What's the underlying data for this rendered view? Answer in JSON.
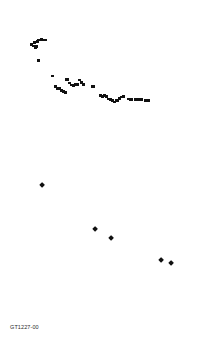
{
  "figure": {
    "code": "GT1227-00"
  },
  "panel_a": {
    "label": "(a)",
    "ylabel": "Immobile element ratio",
    "xlabel": "cm",
    "yticks": [
      "0",
      "1",
      "2",
      "3",
      "4",
      "5"
    ],
    "xticks": [
      "0",
      "2000",
      "4000"
    ]
  },
  "panel_b": {
    "label": "(b)",
    "ylabel": "Sueoka's index",
    "xlabel": "Density (g/ml)",
    "yticks": [
      "0",
      "10",
      "20",
      "30",
      "40",
      "50",
      "60",
      "70",
      "80"
    ],
    "xticks": [
      "1.8",
      "2",
      "2.2",
      "2.4",
      "2.6",
      "2.8"
    ]
  },
  "chart_data": [
    {
      "type": "scatter",
      "title": "(a)",
      "xlabel": "cm",
      "ylabel": "Immobile element ratio",
      "xlim": [
        0,
        4000
      ],
      "ylim": [
        0,
        5
      ],
      "xticks": [
        0,
        2000,
        4000
      ],
      "yticks": [
        0,
        1,
        2,
        3,
        4,
        5
      ],
      "grid": false,
      "legend": false,
      "marker": "square",
      "color": "#111111",
      "points": [
        {
          "x": 20,
          "y": 3.8
        },
        {
          "x": 55,
          "y": 3.72
        },
        {
          "x": 95,
          "y": 3.9
        },
        {
          "x": 120,
          "y": 3.62
        },
        {
          "x": 150,
          "y": 3.7
        },
        {
          "x": 175,
          "y": 3.95
        },
        {
          "x": 205,
          "y": 4.0
        },
        {
          "x": 240,
          "y": 4.0
        },
        {
          "x": 275,
          "y": 4.02
        },
        {
          "x": 310,
          "y": 4.0
        },
        {
          "x": 345,
          "y": 4.0
        },
        {
          "x": 385,
          "y": 4.0
        },
        {
          "x": 190,
          "y": 3.0
        },
        {
          "x": 560,
          "y": 2.22
        },
        {
          "x": 640,
          "y": 1.72
        },
        {
          "x": 690,
          "y": 1.62
        },
        {
          "x": 735,
          "y": 1.6
        },
        {
          "x": 790,
          "y": 1.52
        },
        {
          "x": 830,
          "y": 1.45
        },
        {
          "x": 880,
          "y": 1.42
        },
        {
          "x": 930,
          "y": 2.05
        },
        {
          "x": 985,
          "y": 1.88
        },
        {
          "x": 1040,
          "y": 1.78
        },
        {
          "x": 1090,
          "y": 1.76
        },
        {
          "x": 1150,
          "y": 1.8
        },
        {
          "x": 1205,
          "y": 1.82
        },
        {
          "x": 1260,
          "y": 2.02
        },
        {
          "x": 1310,
          "y": 1.92
        },
        {
          "x": 1365,
          "y": 1.82
        },
        {
          "x": 1600,
          "y": 1.7
        },
        {
          "x": 1790,
          "y": 1.25
        },
        {
          "x": 1840,
          "y": 1.22
        },
        {
          "x": 1890,
          "y": 1.25
        },
        {
          "x": 1945,
          "y": 1.22
        },
        {
          "x": 2000,
          "y": 1.08
        },
        {
          "x": 2055,
          "y": 1.05
        },
        {
          "x": 2110,
          "y": 1.02
        },
        {
          "x": 2165,
          "y": 0.95
        },
        {
          "x": 2220,
          "y": 1.02
        },
        {
          "x": 2275,
          "y": 1.1
        },
        {
          "x": 2330,
          "y": 1.18
        },
        {
          "x": 2390,
          "y": 1.2
        },
        {
          "x": 2520,
          "y": 1.08
        },
        {
          "x": 2580,
          "y": 1.05
        },
        {
          "x": 2700,
          "y": 1.05
        },
        {
          "x": 2780,
          "y": 1.05
        },
        {
          "x": 2860,
          "y": 1.05
        },
        {
          "x": 2960,
          "y": 1.02
        },
        {
          "x": 3040,
          "y": 1.02
        }
      ]
    },
    {
      "type": "scatter",
      "title": "(b)",
      "xlabel": "Density (g/ml)",
      "ylabel": "Sueoka's index",
      "xlim": [
        1.8,
        2.8
      ],
      "ylim": [
        0,
        80
      ],
      "xticks": [
        1.8,
        2.0,
        2.2,
        2.4,
        2.6,
        2.8
      ],
      "yticks": [
        0,
        10,
        20,
        30,
        40,
        50,
        60,
        70,
        80
      ],
      "grid": false,
      "legend": false,
      "marker": "diamond",
      "color": "#111111",
      "points": [
        {
          "x": 1.825,
          "y": 73.0
        },
        {
          "x": 2.15,
          "y": 45.5
        },
        {
          "x": 2.25,
          "y": 40.0
        },
        {
          "x": 2.56,
          "y": 26.0
        },
        {
          "x": 2.62,
          "y": 24.5
        }
      ]
    }
  ]
}
